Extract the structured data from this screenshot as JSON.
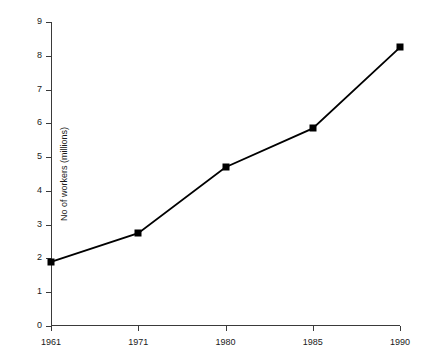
{
  "chart_data": {
    "type": "line",
    "title": "THE WORLD'S WORKERS",
    "subtitle": "",
    "xlabel": "",
    "ylabel": "No of workers (millions)",
    "categories": [
      "1961",
      "1971",
      "1980",
      "1985",
      "1990"
    ],
    "values": [
      1.9,
      2.75,
      4.7,
      5.85,
      8.25
    ],
    "series": [
      {
        "name": "No of workers (millions)",
        "values": [
          1.9,
          2.75,
          4.7,
          5.85,
          8.25
        ]
      }
    ],
    "ylim": [
      0,
      9
    ],
    "ytick_labels": [
      "0",
      "1",
      "2",
      "3",
      "4",
      "5",
      "6",
      "7",
      "8",
      "9"
    ],
    "ytick_values": [
      0,
      1,
      2,
      3,
      4,
      5,
      6,
      7,
      8,
      9
    ],
    "xtick_labels": [
      "1961",
      "1971",
      "1980",
      "1985",
      "1990"
    ],
    "grid": false,
    "legend": false,
    "legend_position": "none",
    "annotations": [],
    "marker": "square",
    "colors": {
      "line": "#000000",
      "marker": "#000000",
      "axis": "#3a3a3a",
      "text": "#1a1a1a",
      "background": "#ffffff",
      "title": "#8a8a8a"
    }
  }
}
